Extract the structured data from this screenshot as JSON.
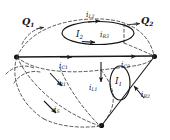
{
  "figure": {
    "type": "circuit-topology-diagram",
    "background_color": "#ffffff",
    "line_color": "#1a1a1a",
    "dashed_color": "#3a3a3a"
  },
  "labels": {
    "flux_left": {
      "base": "Q",
      "sub": "1"
    },
    "flux_right": {
      "base": "Q",
      "sub": "2"
    },
    "loop_top": {
      "base": "I",
      "sub": "2"
    },
    "loop_right": {
      "base": "I",
      "sub": "1"
    },
    "current_l2": {
      "base": "i",
      "sub": "L2"
    },
    "current_l1": {
      "base": "i",
      "sub": "L1"
    },
    "current_c1": {
      "base": "i",
      "sub": "C1"
    },
    "current_c2": {
      "base": "i",
      "sub": "C2"
    },
    "current_r1": {
      "base": "i",
      "sub": "R1"
    },
    "current_r2": {
      "base": "i",
      "sub": "R2"
    },
    "current_r3": {
      "base": "i",
      "sub": "R3"
    },
    "current_s": {
      "base": "i",
      "sub": "S"
    }
  },
  "nodes": {
    "left_vertex": {
      "x": 16,
      "y": 57
    },
    "right_vertex": {
      "x": 155,
      "y": 56
    },
    "bottom_vertex": {
      "x": 101,
      "y": 126
    },
    "mid_top": {
      "x": 101,
      "y": 57
    }
  }
}
